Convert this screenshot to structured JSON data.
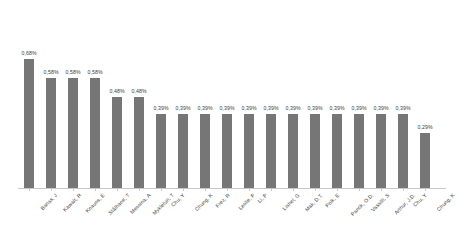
{
  "chart_data": {
    "type": "bar",
    "title": "",
    "subtitle": "",
    "xlabel": "",
    "ylabel": "",
    "grid": false,
    "legend": false,
    "ylim": [
      0,
      0.8
    ],
    "value_suffix": "%",
    "decimal_separator": ",",
    "bar_color": "#767676",
    "axis_color": "#c9c9c9",
    "label_color": "#3a3a3a",
    "categories": [
      "Banas, J",
      "Kawalt, R",
      "Knauss, E",
      "Stålhane, T",
      "Messina, A",
      "Mykletun, T",
      "Chu, Y",
      "Chung, K",
      "Frez, R",
      "Leslie, P",
      "Li, P",
      "Lishel, G",
      "Mak, D.T.",
      "Polk, E",
      "Pantik, O.D.",
      "Vassilli, S",
      "Arthur, J.D.",
      "Chu, Y",
      "Chung, K"
    ],
    "values": [
      0.68,
      0.58,
      0.58,
      0.58,
      0.48,
      0.48,
      0.39,
      0.39,
      0.39,
      0.39,
      0.39,
      0.39,
      0.39,
      0.39,
      0.39,
      0.39,
      0.39,
      0.39,
      0.29
    ],
    "value_labels": [
      "0,68%",
      "0,58%",
      "0,58%",
      "0,58%",
      "0,48%",
      "0,48%",
      "0,39%",
      "0,39%",
      "0,39%",
      "0,39%",
      "0,39%",
      "0,39%",
      "0,39%",
      "0,39%",
      "0,39%",
      "0,39%",
      "0,39%",
      "0,39%",
      "0,29%"
    ],
    "category_labels": [
      "Banas, J",
      "Kawalt, R",
      "Knauss, E",
      "Stålhane, T",
      "Messina, A",
      "Mykletun, T",
      "Chu, Y",
      "Chung, K",
      "Frez, R",
      "Leslie, P",
      "Li, P",
      "Lishel, G",
      "Mak, D.T.",
      "Polk, E",
      "Pantik, O.D.",
      "Vassilli, S",
      "Arthur, J.D.",
      "Chu, Y",
      "Chung, K"
    ]
  }
}
